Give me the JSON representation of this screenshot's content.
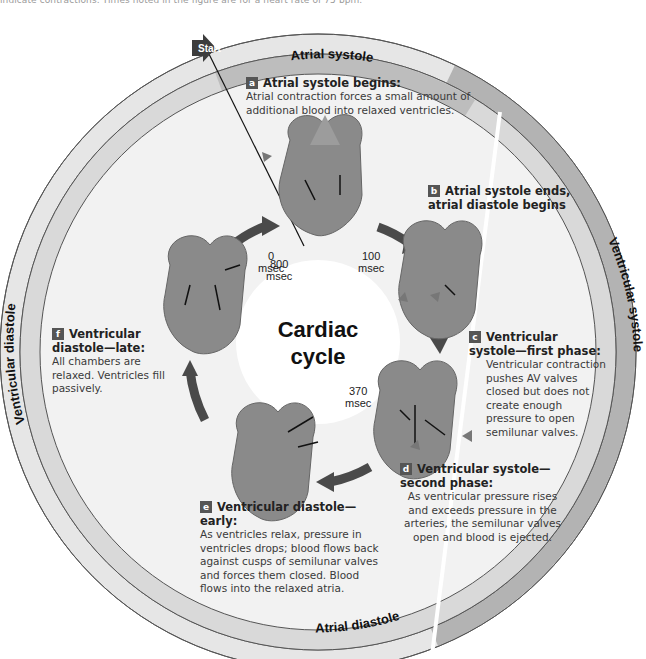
{
  "caption": "indicate contractions. Times noted in the figure are for a heart rate of 75 bpm.",
  "start_label": "Start",
  "center": {
    "line1": "Cardiac",
    "line2": "cycle"
  },
  "rings": {
    "outer": {
      "ventricular_diastole": "Ventricular diastole",
      "ventricular_systole": "Ventricular systole"
    },
    "inner": {
      "atrial_systole": "Atrial systole",
      "atrial_diastole": "Atrial diastole"
    }
  },
  "times": {
    "t0": {
      "value": "0",
      "unit": "msec"
    },
    "t100": {
      "value": "100",
      "unit": "msec"
    },
    "t370": {
      "value": "370",
      "unit": "msec"
    },
    "t800": {
      "value": "800",
      "unit": "msec"
    }
  },
  "steps": [
    {
      "badge": "a",
      "title": "Atrial systole begins:",
      "body": "Atrial contraction forces a small amount of additional blood into relaxed ventricles."
    },
    {
      "badge": "b",
      "title": "Atrial systole ends, atrial diastole begins",
      "body": ""
    },
    {
      "badge": "c",
      "title": "Ventricular systole—first phase:",
      "body": "Ventricular contraction pushes AV valves closed but does not create enough pressure to open semilunar valves."
    },
    {
      "badge": "d",
      "title": "Ventricular systole—second phase:",
      "body": "As ventricular pressure rises and exceeds pressure in the arteries, the semilunar valves open and blood is ejected."
    },
    {
      "badge": "e",
      "title": "Ventricular diastole—early:",
      "body": "As ventricles relax, pressure in ventricles drops; blood flows back against cusps of semilunar valves and forces them closed. Blood flows into the relaxed atria."
    },
    {
      "badge": "f",
      "title": "Ventricular diastole—late:",
      "body": "All chambers are relaxed. Ventricles fill passively."
    }
  ],
  "colors": {
    "outer_diastole": "#e6e6e6",
    "outer_systole": "#b3b3b3",
    "inner_systole": "#bdbdbd",
    "inner_diastole": "#d9d9d9",
    "disc": "#f2f2f2",
    "heart": "#8a8a8a",
    "arrow": "#4a4a4a"
  }
}
